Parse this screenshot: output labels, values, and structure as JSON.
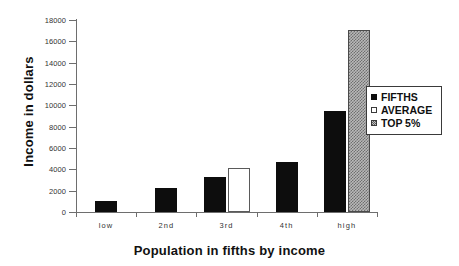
{
  "chart_data": {
    "type": "bar",
    "title": "",
    "xlabel": "Population in fifths by income",
    "ylabel": "Income in dollars",
    "categories": [
      "low",
      "2nd",
      "3rd",
      "4th",
      "high"
    ],
    "series": [
      {
        "name": "FIFTHS",
        "values": [
          1000,
          2250,
          3300,
          4650,
          9500
        ]
      },
      {
        "name": "AVERAGE",
        "values": [
          null,
          null,
          4150,
          null,
          null
        ]
      },
      {
        "name": "TOP 5%",
        "values": [
          null,
          null,
          null,
          null,
          17100
        ]
      }
    ],
    "ylim": [
      0,
      18000
    ],
    "yticks": [
      0,
      2000,
      4000,
      6000,
      8000,
      10000,
      12000,
      14000,
      16000,
      18000
    ],
    "ytick_labels": [
      "0",
      "2000",
      "4000",
      "6000",
      "8000",
      "10000",
      "12000",
      "14000",
      "16000",
      "18000"
    ],
    "grid": false,
    "legend_position": "center right",
    "legend_entries": [
      {
        "label": "FIFTHS",
        "swatch": "filled-black-square"
      },
      {
        "label": "AVERAGE",
        "swatch": "empty-white-square"
      },
      {
        "label": "TOP 5%",
        "swatch": "hatched-gray-square"
      }
    ],
    "colors": {
      "fifths": "#0d0d0d",
      "average": "#ffffff",
      "top5": "#b9b9b9",
      "axis": "#6e6e6e",
      "text": "#111111",
      "background": "#ffffff"
    }
  }
}
